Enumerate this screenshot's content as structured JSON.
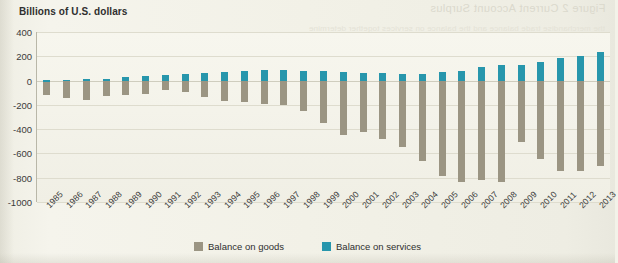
{
  "page": {
    "bleed_text_top": "Figure 2  Current Account Surplus",
    "bleed_text_line": "the merchandise trade balance and the balance on services together determine",
    "background_color": "#f2f1e7"
  },
  "chart_data": {
    "type": "bar",
    "title": "Billions of U.S. dollars",
    "subtitle": "",
    "xlabel": "",
    "ylabel": "Billions of U.S. dollars",
    "ylim": [
      -1000,
      400
    ],
    "yticks": [
      400,
      200,
      0,
      -200,
      -400,
      -600,
      -800,
      -1000
    ],
    "ytick_labels": [
      "400",
      "200",
      "0",
      "-200",
      "-400",
      "-600",
      "-800",
      "-1000"
    ],
    "grid": true,
    "legend_position": "bottom-center",
    "colors": {
      "goods": "#9b9583",
      "services": "#2796ac"
    },
    "categories": [
      "1985",
      "1986",
      "1987",
      "1988",
      "1989",
      "1990",
      "1991",
      "1992",
      "1993",
      "1994",
      "1995",
      "1996",
      "1997",
      "1998",
      "1999",
      "2000",
      "2001",
      "2002",
      "2003",
      "2004",
      "2005",
      "2006",
      "2007",
      "2008",
      "2009",
      "2010",
      "2011",
      "2012",
      "2013"
    ],
    "series": [
      {
        "name": "Balance on goods",
        "color": "#9b9583",
        "values": [
          -122,
          -145,
          -160,
          -127,
          -116,
          -111,
          -77,
          -97,
          -133,
          -166,
          -174,
          -191,
          -198,
          -248,
          -346,
          -452,
          -427,
          -482,
          -547,
          -666,
          -783,
          -837,
          -821,
          -834,
          -510,
          -650,
          -741,
          -742,
          -702
        ]
      },
      {
        "name": "Balance on services",
        "color": "#2796ac",
        "values": [
          1,
          7,
          9,
          14,
          30,
          38,
          50,
          58,
          61,
          67,
          77,
          87,
          90,
          82,
          82,
          74,
          64,
          61,
          52,
          54,
          68,
          76,
          113,
          126,
          129,
          154,
          187,
          204,
          232
        ]
      }
    ]
  },
  "legend": {
    "items": [
      {
        "label": "Balance on goods",
        "color": "#9b9583",
        "key": "goods"
      },
      {
        "label": "Balance on services",
        "color": "#2796ac",
        "key": "services"
      }
    ]
  }
}
